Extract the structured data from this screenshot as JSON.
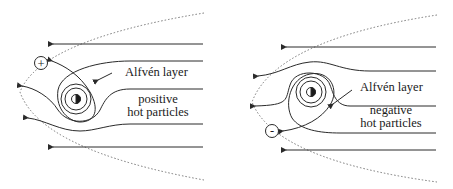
{
  "left_panel": {
    "charge_symbol": "+",
    "layer_label": "Alfvén layer",
    "particles_line1": "positive",
    "particles_line2": "hot particles"
  },
  "right_panel": {
    "charge_symbol": "-",
    "layer_label": "Alfvén layer",
    "particles_line1": "negative",
    "particles_line2": "hot particles"
  },
  "colors": {
    "line": "#2a2a2a",
    "dotted": "#666666",
    "background": "#ffffff"
  }
}
